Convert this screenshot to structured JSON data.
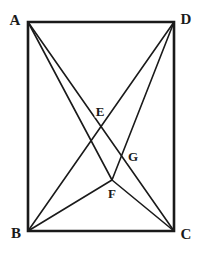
{
  "figure": {
    "background_color": "#ffffff",
    "stroke_color": "#1a1a1a",
    "label_color": "#1a1a1a",
    "rect_stroke_width": 2.6,
    "line_stroke_width": 1.6,
    "canvas": {
      "width": 200,
      "height": 253
    }
  },
  "points": {
    "A": {
      "label": "A",
      "x": 28,
      "y": 22,
      "label_x": 15,
      "label_y": 20
    },
    "D": {
      "label": "D",
      "x": 174,
      "y": 22,
      "label_x": 186,
      "label_y": 19
    },
    "B": {
      "label": "B",
      "x": 28,
      "y": 231,
      "label_x": 16,
      "label_y": 233
    },
    "C": {
      "label": "C",
      "x": 174,
      "y": 231,
      "label_x": 186,
      "label_y": 234
    },
    "E": {
      "label": "E",
      "x": 101,
      "y": 128,
      "label_x": 100,
      "label_y": 111
    },
    "F": {
      "label": "F",
      "x": 112,
      "y": 180,
      "label_x": 112,
      "label_y": 193
    },
    "G": {
      "label": "G",
      "x": 124,
      "y": 155,
      "label_x": 133,
      "label_y": 156
    }
  },
  "rectangle": {
    "name": "ABCD",
    "vertices": [
      "A",
      "D",
      "C",
      "B"
    ]
  },
  "segments": [
    {
      "name": "A-C",
      "from": "A",
      "to": "C",
      "kind": "diagonal"
    },
    {
      "name": "B-D",
      "from": "B",
      "to": "D",
      "kind": "diagonal"
    },
    {
      "name": "A-F",
      "from": "A",
      "to": "F",
      "kind": "cevian"
    },
    {
      "name": "B-F",
      "from": "B",
      "to": "F",
      "kind": "cevian"
    },
    {
      "name": "D-F",
      "from": "D",
      "to": "F",
      "kind": "cevian"
    },
    {
      "name": "F-C",
      "from": "F",
      "to": "C",
      "kind": "cevian"
    }
  ],
  "intersections": [
    {
      "name": "E",
      "of": [
        "A-C",
        "D-F"
      ]
    },
    {
      "name": "G",
      "of": [
        "B-D",
        "F-C"
      ]
    },
    {
      "name": "F",
      "of": [
        "A-F",
        "B-F",
        "D-F",
        "F-C"
      ]
    }
  ]
}
